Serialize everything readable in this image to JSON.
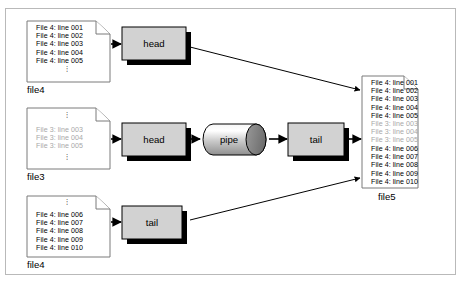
{
  "diagram": {
    "frame": {
      "border_color": "#b9b9b9",
      "background": "#ffffff"
    },
    "colors": {
      "box_fill": "#d2d2d2",
      "box_stroke": "#000000",
      "box_shadow": "#000000",
      "black_text": "#000000",
      "gray_text": "#a8a8a8",
      "doc_stroke": "#7a7a7a",
      "arrow": "#000000"
    },
    "documents": [
      {
        "id": "file4-top",
        "label": "file4",
        "lines": [
          {
            "text": "File 4: line 001",
            "color": "black"
          },
          {
            "text": "File 4: line 002",
            "color": "black"
          },
          {
            "text": "File 4: line 003",
            "color": "black"
          },
          {
            "text": "File 4: line 004",
            "color": "black"
          },
          {
            "text": "File 4: line 005",
            "color": "black"
          }
        ],
        "dots_top": false,
        "dots_bottom": true
      },
      {
        "id": "file3",
        "label": "file3",
        "lines": [
          {
            "text": "File 3: line 003",
            "color": "gray"
          },
          {
            "text": "File 3: line 004",
            "color": "gray"
          },
          {
            "text": "File 3: line 005",
            "color": "gray"
          }
        ],
        "dots_top": true,
        "dots_bottom": true
      },
      {
        "id": "file4-bottom",
        "label": "file4",
        "lines": [
          {
            "text": "File 4: line 006",
            "color": "black"
          },
          {
            "text": "File 4: line 007",
            "color": "black"
          },
          {
            "text": "File 4: line 008",
            "color": "black"
          },
          {
            "text": "File 4: line 009",
            "color": "black"
          },
          {
            "text": "File 4: line 010",
            "color": "black"
          }
        ],
        "dots_top": true,
        "dots_bottom": false
      },
      {
        "id": "file5",
        "label": "file5",
        "lines": [
          {
            "text": "File 4: line 001",
            "color": "black"
          },
          {
            "text": "File 4: line 002",
            "color": "black"
          },
          {
            "text": "File 4: line 003",
            "color": "black"
          },
          {
            "text": "File 4: line 004",
            "color": "black"
          },
          {
            "text": "File 4: line 005",
            "color": "black"
          },
          {
            "text": "File 3: line 003",
            "color": "gray"
          },
          {
            "text": "File 3: line 004",
            "color": "gray"
          },
          {
            "text": "File 3: line 005",
            "color": "gray"
          },
          {
            "text": "File 4: line 006",
            "color": "black"
          },
          {
            "text": "File 4: line 007",
            "color": "black"
          },
          {
            "text": "File 4: line 008",
            "color": "black"
          },
          {
            "text": "File 4: line 009",
            "color": "black"
          },
          {
            "text": "File 4: line 010",
            "color": "black"
          }
        ],
        "dots_top": false,
        "dots_bottom": false
      }
    ],
    "nodes": [
      {
        "id": "head-top",
        "label": "head",
        "shape": "box"
      },
      {
        "id": "head-mid",
        "label": "head",
        "shape": "box"
      },
      {
        "id": "pipe",
        "label": "pipe",
        "shape": "cylinder"
      },
      {
        "id": "tail-mid",
        "label": "tail",
        "shape": "box"
      },
      {
        "id": "tail-bottom",
        "label": "tail",
        "shape": "box"
      }
    ],
    "dots_glyph": "⋮"
  }
}
